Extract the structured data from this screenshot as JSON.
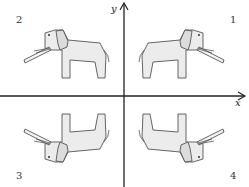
{
  "figure": {
    "axes": {
      "x_label": "x",
      "y_label": "y",
      "origin_px": [
        124,
        96
      ],
      "color": "#222222"
    },
    "quadrants": [
      {
        "number": "1",
        "label_pos": [
          230,
          22
        ],
        "orientation": "faces right, upright"
      },
      {
        "number": "2",
        "label_pos": [
          16,
          22
        ],
        "orientation": "faces left, upright"
      },
      {
        "number": "3",
        "label_pos": [
          16,
          178
        ],
        "orientation": "faces left, upside down"
      },
      {
        "number": "4",
        "label_pos": [
          230,
          178
        ],
        "orientation": "faces right, upside down"
      }
    ],
    "colors": {
      "body_fill": "#ececec",
      "ear_fill": "#dcdcdc",
      "outline": "#555555"
    }
  }
}
